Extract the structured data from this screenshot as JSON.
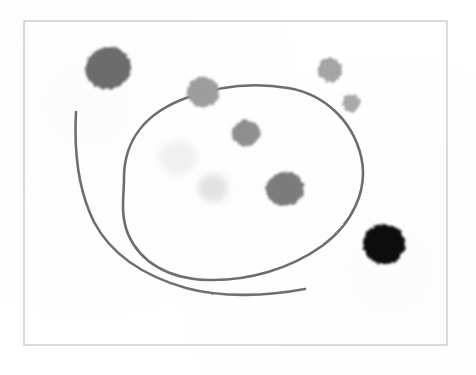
{
  "image": {
    "title": "Hand-drawn scan: looping line with scattered round blobs",
    "width": 476,
    "height": 375,
    "background_color": "#ffffff",
    "alt_text": "A scanned sheet with a thin gray rectangular border containing a large hand-drawn closed loop, a separate curving tail line, and eight round smudge blobs of varying darkness."
  },
  "frame": {
    "name": "page-border",
    "x": 24,
    "y": 21,
    "width": 423,
    "height": 324,
    "stroke_color": "#b9b9b9",
    "stroke_width": 1
  },
  "strokes": [
    {
      "name": "main-loop",
      "label": "Large closed loop",
      "stroke_color": "#6e6e6e",
      "stroke_width": 2.6,
      "closed": true,
      "path": "M 124 178 C 124 138, 148 112, 186 98 C 216 87, 252 82, 288 88 C 324 94, 352 120, 361 156 C 369 190, 352 224, 322 246 C 290 269, 248 281, 208 280 C 168 279, 140 262, 128 234 C 120 214, 124 196, 124 178 Z"
    },
    {
      "name": "tail-line",
      "label": "Long open curving tail line",
      "stroke_color": "#707070",
      "stroke_width": 2.6,
      "closed": false,
      "path": "M 76 112 C 74 150, 78 190, 94 222 C 112 256, 144 276, 186 288 C 222 298, 268 296, 305 289"
    }
  ],
  "blobs": [
    {
      "name": "blob-top-left-dark",
      "cx": 108,
      "cy": 68,
      "rx": 23,
      "ry": 21,
      "color": "#6d6d6d",
      "tone": "dark-gray",
      "rotation": -12
    },
    {
      "name": "blob-upper-mid-gray",
      "cx": 203,
      "cy": 92,
      "rx": 16,
      "ry": 15,
      "color": "#9e9e9e",
      "tone": "mid-gray",
      "rotation": 8
    },
    {
      "name": "blob-upper-right-gray",
      "cx": 330,
      "cy": 70,
      "rx": 12,
      "ry": 12,
      "color": "#a5a5a5",
      "tone": "mid-light-gray",
      "rotation": 0
    },
    {
      "name": "blob-right-small-gray",
      "cx": 351,
      "cy": 103,
      "rx": 9,
      "ry": 9,
      "color": "#aaaaaa",
      "tone": "light-gray",
      "rotation": 0
    },
    {
      "name": "blob-center-gray",
      "cx": 246,
      "cy": 133,
      "rx": 14,
      "ry": 13,
      "color": "#8f8f8f",
      "tone": "mid-gray",
      "rotation": 5
    },
    {
      "name": "blob-faint-left",
      "cx": 178,
      "cy": 158,
      "rx": 19,
      "ry": 17,
      "color": "#f2f2f2",
      "tone": "very-faint",
      "rotation": -6
    },
    {
      "name": "blob-faint-center",
      "cx": 213,
      "cy": 188,
      "rx": 15,
      "ry": 14,
      "color": "#e4e4e4",
      "tone": "faint-gray",
      "rotation": 4
    },
    {
      "name": "blob-lower-mid-dark",
      "cx": 285,
      "cy": 189,
      "rx": 19,
      "ry": 17,
      "color": "#7b7b7b",
      "tone": "dark-gray",
      "rotation": -10
    },
    {
      "name": "blob-lower-right-black",
      "cx": 384,
      "cy": 244,
      "rx": 21,
      "ry": 20,
      "color": "#0d0d0d",
      "tone": "black",
      "rotation": 6
    }
  ],
  "palette": {
    "paper": "#ffffff",
    "frame_gray": "#b9b9b9",
    "ink_gray": "#6e6e6e",
    "blob_black": "#0d0d0d"
  }
}
